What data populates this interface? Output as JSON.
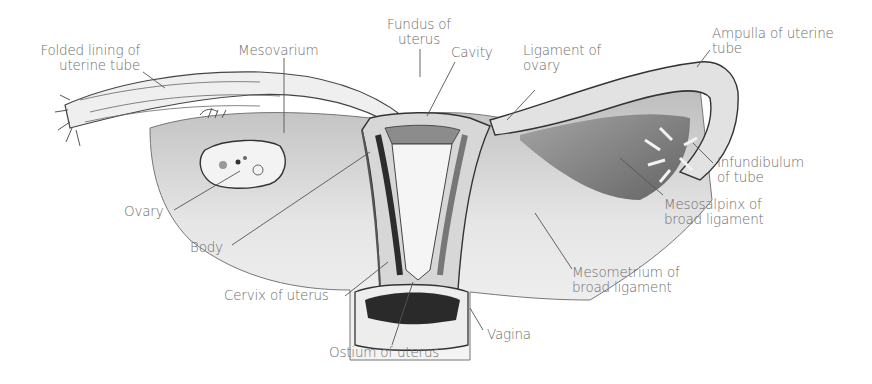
{
  "diagram": {
    "colors": {
      "label_text": "#6e6e6e",
      "leader_line": "#555555",
      "illustration_ink": "#2a2a2a",
      "background": "#ffffff"
    },
    "labels": [
      {
        "id": "folded-lining",
        "line1": "Folded lining of",
        "line2": "uterine tube"
      },
      {
        "id": "mesovarium",
        "line1": "Mesovarium",
        "line2": ""
      },
      {
        "id": "fundus",
        "line1": "Fundus of",
        "line2": "uterus"
      },
      {
        "id": "cavity",
        "line1": "Cavity",
        "line2": ""
      },
      {
        "id": "ligament-ovary",
        "line1": "Ligament of",
        "line2": "ovary"
      },
      {
        "id": "ampulla",
        "line1": "Ampulla of uterine",
        "line2": "tube"
      },
      {
        "id": "infundibulum",
        "line1": "Infundibulum",
        "line2": "of tube"
      },
      {
        "id": "mesosalpinx",
        "line1": "Mesosalpinx of",
        "line2": "broad ligament"
      },
      {
        "id": "ovary",
        "line1": "Ovary",
        "line2": ""
      },
      {
        "id": "body",
        "line1": "Body",
        "line2": ""
      },
      {
        "id": "mesometrium",
        "line1": "Mesometrium of",
        "line2": "broad ligament"
      },
      {
        "id": "cervix",
        "line1": "Cervix of uterus",
        "line2": ""
      },
      {
        "id": "vagina",
        "line1": "Vagina",
        "line2": ""
      },
      {
        "id": "ostium",
        "line1": "Ostium of uterus",
        "line2": ""
      }
    ]
  }
}
